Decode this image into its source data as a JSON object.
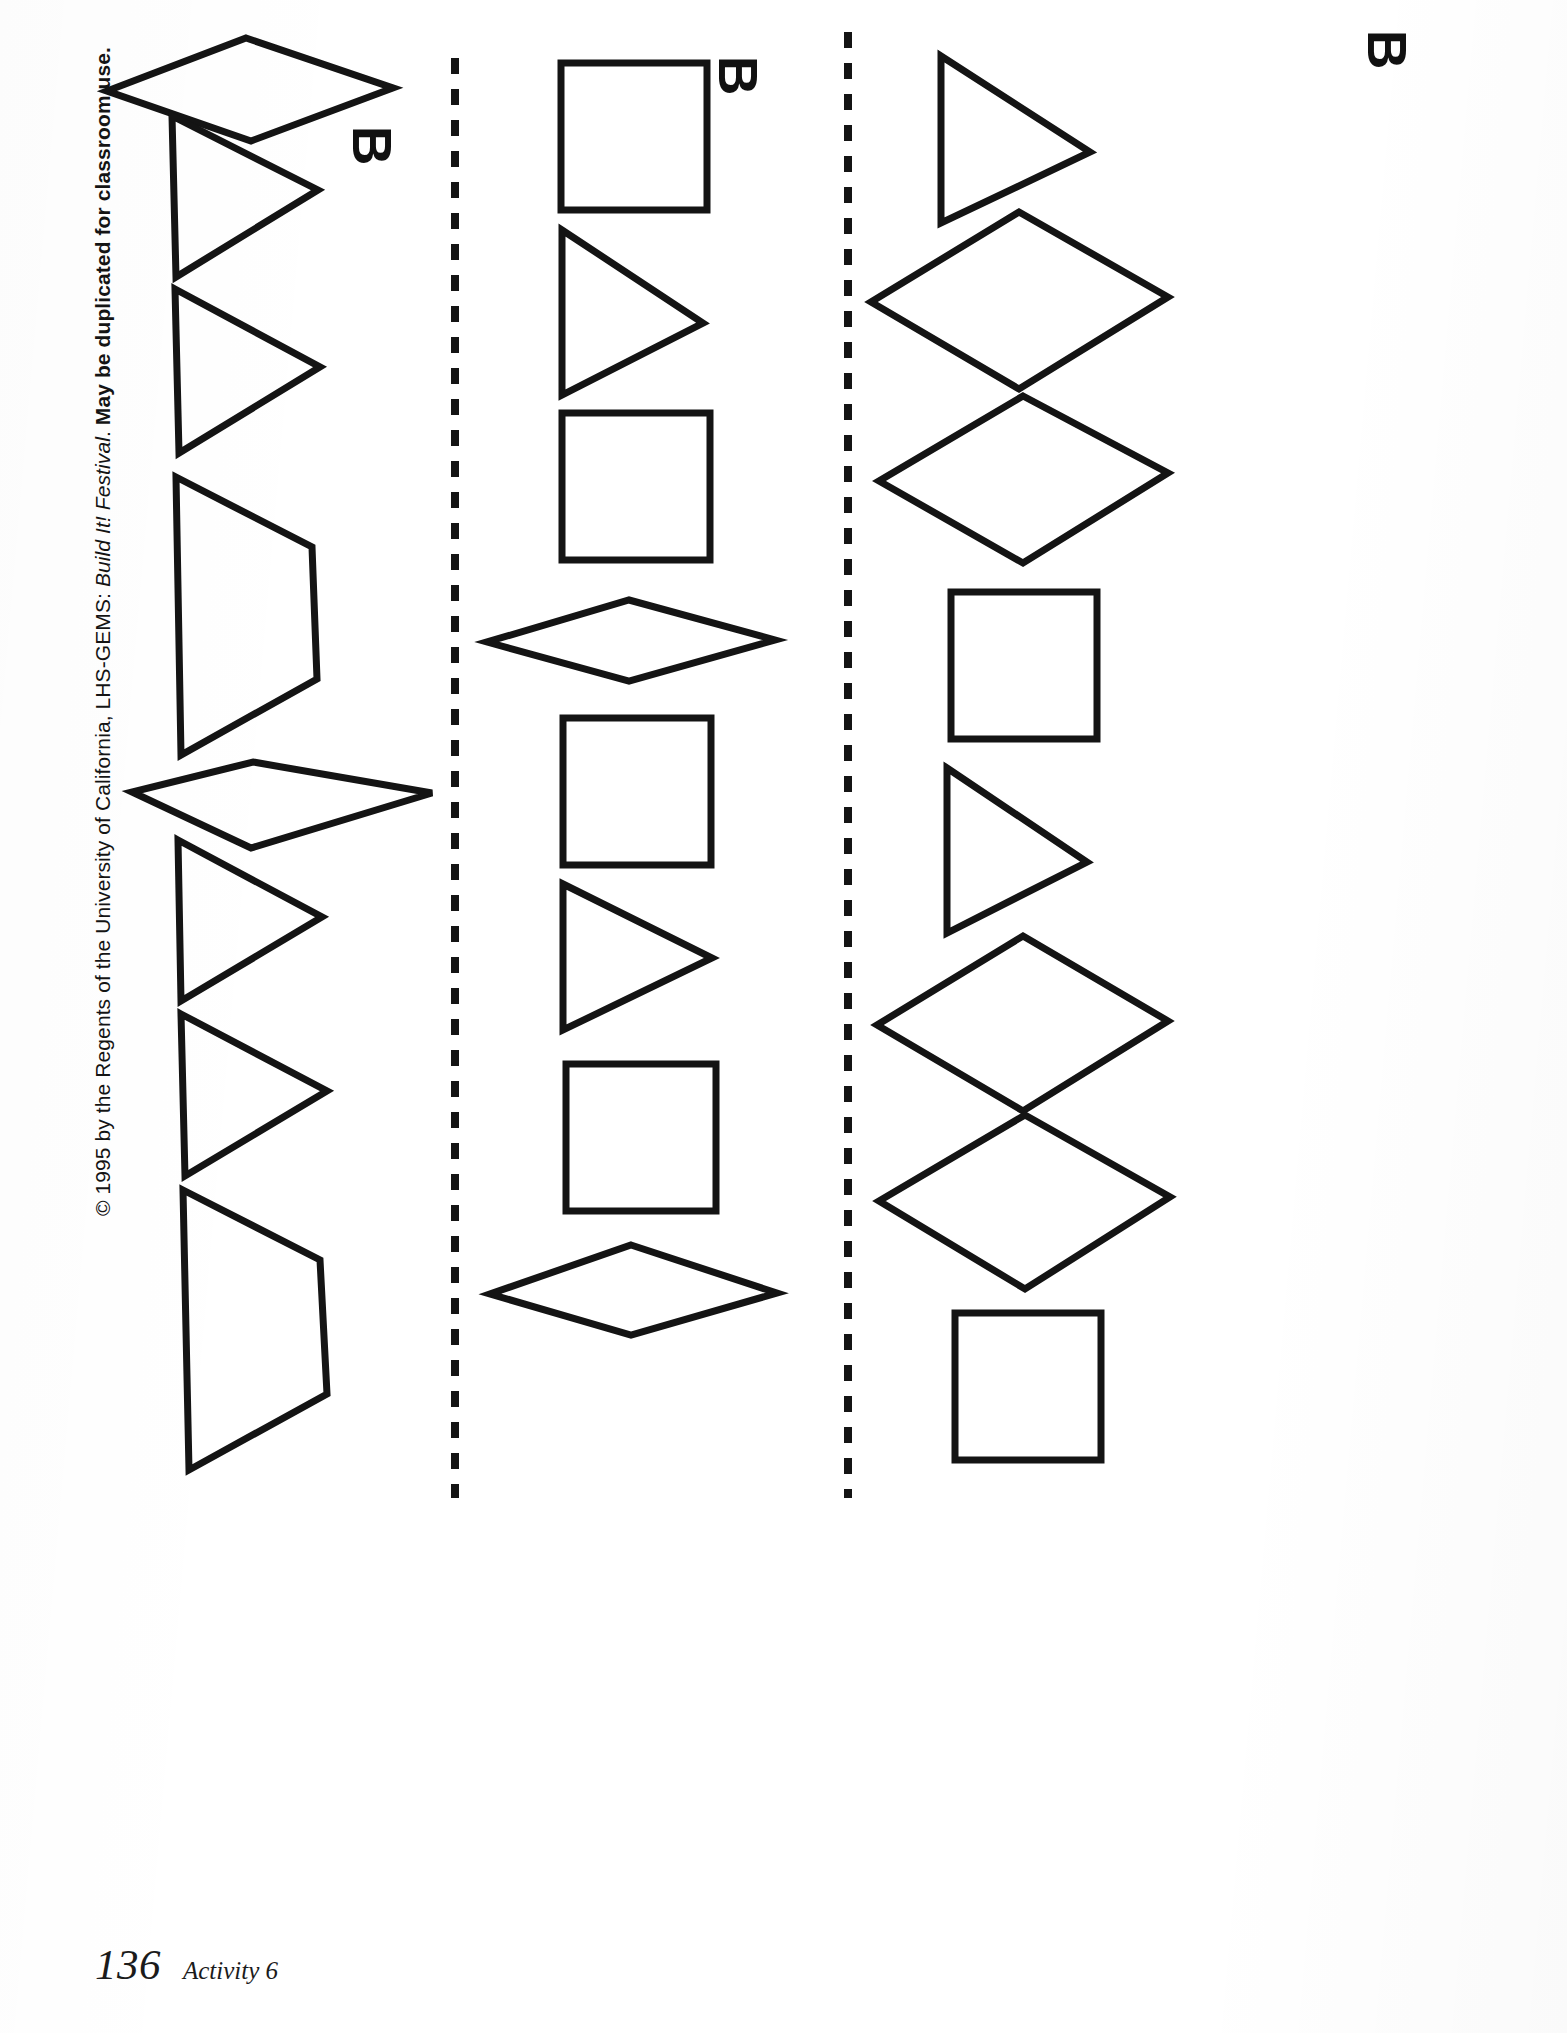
{
  "document": {
    "kind": "worksheet-cut-out-shapes-page",
    "orientation": "landscape-content-on-portrait-scan",
    "background_color": "#ffffff",
    "ink_color": "#141414"
  },
  "copyright": {
    "symbol": "©",
    "year": "1995",
    "line_plain_1": "© 1995 by the Regents of the University of California, LHS-GEMS: ",
    "line_italic": "Build It! Festival",
    "line_plain_2": ". ",
    "line_bold": "May be duplicated for classroom use.",
    "full_text": "© 1995 by the Regents of the University of California, LHS-GEMS: Build It! Festival. May be duplicated for classroom use."
  },
  "footer": {
    "page_number": "136",
    "activity_label": "Activity 6"
  },
  "labels": {
    "column_1": "B",
    "column_2": "B",
    "column_3": "B"
  },
  "cut_lines": [
    {
      "name": "cut-line-right",
      "x": 848,
      "y1": 30,
      "y2": 1500
    },
    {
      "name": "cut-line-left",
      "x": 455,
      "y1": 55,
      "y2": 1500
    }
  ],
  "columns": [
    {
      "name": "column-b-right",
      "label": "B",
      "shapes": [
        {
          "type": "triangle",
          "name": "triangle-1"
        },
        {
          "type": "rhombus",
          "name": "rhombus-1"
        },
        {
          "type": "rhombus",
          "name": "rhombus-2"
        },
        {
          "type": "square",
          "name": "square-1"
        },
        {
          "type": "triangle",
          "name": "triangle-2"
        },
        {
          "type": "rhombus",
          "name": "rhombus-3"
        },
        {
          "type": "rhombus",
          "name": "rhombus-4"
        },
        {
          "type": "square",
          "name": "square-2"
        }
      ]
    },
    {
      "name": "column-b-middle",
      "label": "B",
      "shapes": [
        {
          "type": "square",
          "name": "square-1"
        },
        {
          "type": "triangle",
          "name": "triangle-1"
        },
        {
          "type": "square",
          "name": "square-2"
        },
        {
          "type": "rhombus-wide",
          "name": "rhombus-1"
        },
        {
          "type": "square",
          "name": "square-3"
        },
        {
          "type": "triangle",
          "name": "triangle-2"
        },
        {
          "type": "square",
          "name": "square-4"
        },
        {
          "type": "rhombus-wide",
          "name": "rhombus-2"
        }
      ]
    },
    {
      "name": "column-b-left",
      "label": "B",
      "shapes": [
        {
          "type": "rhombus-wide",
          "name": "rhombus-1"
        },
        {
          "type": "triangle",
          "name": "triangle-1"
        },
        {
          "type": "triangle",
          "name": "triangle-2"
        },
        {
          "type": "trapezoid",
          "name": "trapezoid-1"
        },
        {
          "type": "rhombus-wide",
          "name": "rhombus-2"
        },
        {
          "type": "triangle",
          "name": "triangle-3"
        },
        {
          "type": "triangle",
          "name": "triangle-4"
        },
        {
          "type": "trapezoid",
          "name": "trapezoid-2"
        }
      ]
    }
  ],
  "geometry": {
    "col_right": {
      "triangle_1": "940,55 1090,152 940,222",
      "rhombus_1": "1018,212 1166,296 1018,388 872,300",
      "rhombus_2": "1022,396 1166,472 1022,562 880,480",
      "square_1": "952,592 1096,592 1096,738 952,738",
      "triangle_2": "948,768 1086,862 948,932",
      "rhombus_3": "1022,935 1166,1020 1022,1110 878,1024",
      "rhombus_4": "1024,1114 1168,1196 1024,1288 880,1200",
      "square_2": "956,1312 1100,1312 1100,1458 956,1458"
    },
    "col_mid": {
      "square_1": "560,62 706,62 706,208 560,208"
    },
    "col_left": {
      "rhombus_1": "245,38 392,88 250,140 108,90"
    }
  }
}
